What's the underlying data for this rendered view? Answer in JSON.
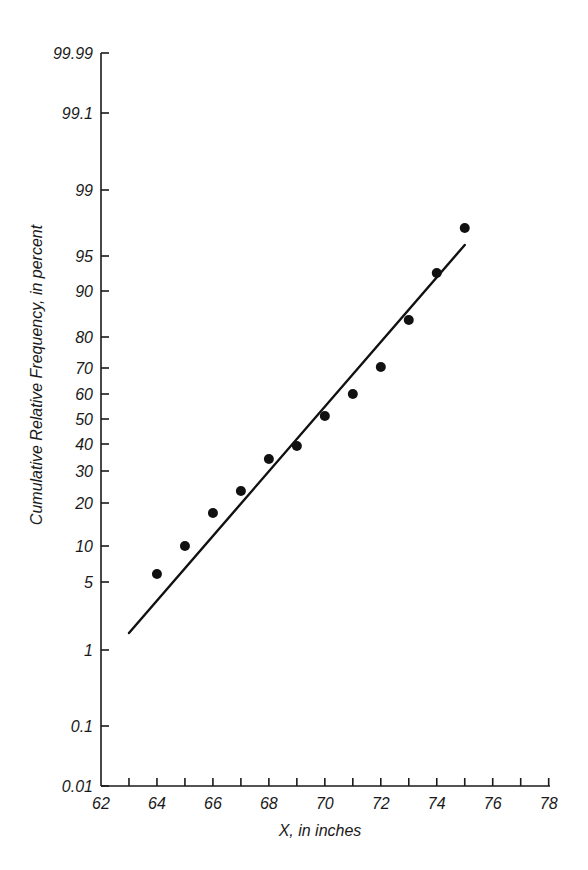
{
  "chart_data": {
    "type": "scatter",
    "title": "",
    "xlabel": "X, in inches",
    "ylabel": "Cumulative Relative Frequency, in percent",
    "xlim": [
      62,
      78
    ],
    "ylim": [
      0.01,
      99.99
    ],
    "y_scale": "normal-probability",
    "grid": false,
    "legend": null,
    "x_ticks": [
      62,
      63,
      64,
      65,
      66,
      67,
      68,
      69,
      70,
      71,
      72,
      73,
      74,
      75,
      76,
      77,
      78
    ],
    "x_tick_labels": [
      "62",
      "64",
      "66",
      "68",
      "70",
      "72",
      "74",
      "76",
      "78"
    ],
    "y_ticks": [
      {
        "label": "99.99",
        "pos": 53
      },
      {
        "label": "99.1",
        "pos": 113
      },
      {
        "label": "99",
        "pos": 190
      },
      {
        "label": "95",
        "pos": 256
      },
      {
        "label": "90",
        "pos": 291
      },
      {
        "label": "80",
        "pos": 337
      },
      {
        "label": "70",
        "pos": 368
      },
      {
        "label": "60",
        "pos": 394
      },
      {
        "label": "50",
        "pos": 419
      },
      {
        "label": "40",
        "pos": 444
      },
      {
        "label": "30",
        "pos": 471
      },
      {
        "label": "20",
        "pos": 503
      },
      {
        "label": "10",
        "pos": 546
      },
      {
        "label": "5",
        "pos": 582
      },
      {
        "label": "1",
        "pos": 650
      },
      {
        "label": "0.1",
        "pos": 726
      },
      {
        "label": "0.01",
        "pos": 786
      }
    ],
    "series": [
      {
        "name": "Observed cumulative relative frequency",
        "kind": "points",
        "x": [
          64,
          65,
          66,
          67,
          68,
          69,
          70,
          71,
          72,
          73,
          74,
          75
        ],
        "values": [
          6,
          10,
          17,
          24,
          34,
          39,
          51,
          60,
          70,
          84,
          93,
          97
        ],
        "pixel_y": [
          574,
          546,
          513,
          491,
          459,
          446,
          416,
          394,
          367,
          320,
          273,
          228
        ]
      },
      {
        "name": "Fitted normal line",
        "kind": "line",
        "x": [
          63,
          75
        ],
        "values": [
          1.6,
          96
        ],
        "pixel_y": [
          633,
          245
        ]
      }
    ]
  }
}
